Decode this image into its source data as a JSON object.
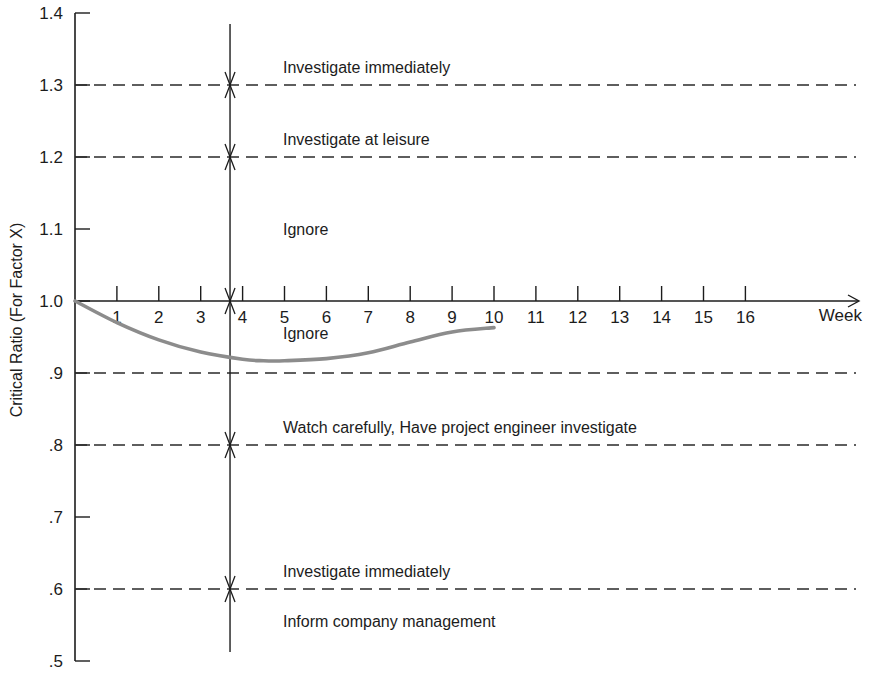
{
  "chart_data": {
    "type": "line",
    "title": "",
    "xlabel": "Week",
    "ylabel": "Critical Ratio (For Factor X)",
    "xlim": [
      0,
      16
    ],
    "ylim": [
      0.5,
      1.4
    ],
    "x_axis_at_y": 1.0,
    "x_ticks": [
      "1",
      "2",
      "3",
      "4",
      "5",
      "6",
      "7",
      "8",
      "9",
      "10",
      "11",
      "12",
      "13",
      "14",
      "15",
      "16"
    ],
    "y_ticks": [
      {
        "value": 1.4,
        "label": "1.4"
      },
      {
        "value": 1.3,
        "label": "1.3"
      },
      {
        "value": 1.2,
        "label": "1.2"
      },
      {
        "value": 1.1,
        "label": "1.1"
      },
      {
        "value": 1.0,
        "label": "1.0"
      },
      {
        "value": 0.9,
        "label": ".9"
      },
      {
        "value": 0.8,
        "label": ".8"
      },
      {
        "value": 0.7,
        "label": ".7"
      },
      {
        "value": 0.6,
        "label": ".6"
      },
      {
        "value": 0.5,
        "label": ".5"
      }
    ],
    "grid": false,
    "threshold_lines": [
      1.3,
      1.2,
      0.9,
      0.8,
      0.6
    ],
    "marker_week": 3.7,
    "series": [
      {
        "name": "Critical ratio",
        "color": "#8c8c8c",
        "x": [
          0,
          1,
          2,
          3,
          4,
          4.5,
          5,
          6,
          7,
          8,
          9,
          10
        ],
        "y": [
          1.0,
          0.97,
          0.946,
          0.929,
          0.919,
          0.917,
          0.917,
          0.92,
          0.928,
          0.943,
          0.957,
          0.963
        ]
      }
    ],
    "zones": [
      {
        "label": "Investigate immediately",
        "y": 1.325
      },
      {
        "label": "Investigate at leisure",
        "y": 1.225
      },
      {
        "label": "Ignore",
        "y": 1.1
      },
      {
        "label": "Ignore",
        "y": 0.955
      },
      {
        "label": "Watch carefully, Have project engineer investigate",
        "y": 0.825
      },
      {
        "label": "Investigate immediately",
        "y": 0.625
      },
      {
        "label": "Inform company management",
        "y": 0.555
      }
    ]
  },
  "labels": {
    "xlabel": "Week",
    "ylabel": "Critical Ratio (For Factor X)"
  }
}
